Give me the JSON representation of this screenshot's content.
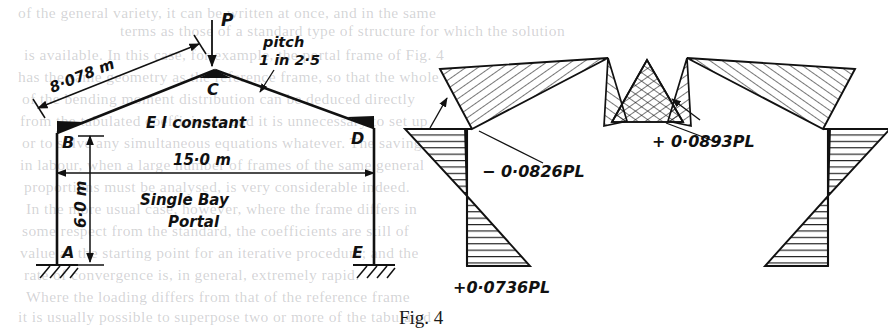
{
  "figure": {
    "caption": "Fig. 4"
  },
  "frame_diagram": {
    "name": "single-bay-portal-frame",
    "load_label": "P",
    "nodes": [
      {
        "id": "A",
        "label": "A",
        "role": "fixed-base-left"
      },
      {
        "id": "B",
        "label": "B",
        "role": "eaves-left"
      },
      {
        "id": "C",
        "label": "C",
        "role": "apex"
      },
      {
        "id": "D",
        "label": "D",
        "role": "eaves-right"
      },
      {
        "id": "E",
        "label": "E",
        "role": "fixed-base-right"
      }
    ],
    "annotations": {
      "rafter_length": "8·078 m",
      "pitch_line_1": "pitch",
      "pitch_line_2": "1 in 2·5",
      "stiffness": "E I  constant",
      "span": "15·0 m",
      "height": "6·0 m",
      "description_line_1": "Single    Bay",
      "description_line_2": "Portal"
    }
  },
  "bmd_diagram": {
    "name": "bending-moment-diagram",
    "labels": {
      "eaves_moment": "− 0·0826PL",
      "apex_moment": "+ 0·0893PL",
      "base_moment": "+0·0736PL"
    }
  },
  "chart_data": {
    "type": "line",
    "xlabel": "",
    "ylabel": "Bending moment (× PL)",
    "grid": false,
    "legend": null,
    "annotations": [
      {
        "text": "− 0·0826PL",
        "value": -0.0826,
        "at": "eaves B and D"
      },
      {
        "text": "+ 0·0893PL",
        "value": 0.0893,
        "at": "apex C"
      },
      {
        "text": "+0·0736PL",
        "value": 0.0736,
        "at": "bases A and E"
      }
    ],
    "categories": [
      "A",
      "B",
      "C",
      "D",
      "E"
    ],
    "values": [
      0.0736,
      -0.0826,
      0.0893,
      -0.0826,
      0.0736
    ],
    "geometry": {
      "span_m": 15.0,
      "column_height_m": 6.0,
      "rafter_length_m": 8.078,
      "pitch": "1 in 2.5"
    }
  },
  "bleed_through": {
    "lines": [
      {
        "text": "of the general variety, it can be written at once, and in the same",
        "x": 18,
        "y": 4
      },
      {
        "text": "terms as those of a standard type of structure for which the solution",
        "x": 120,
        "y": 22
      },
      {
        "text": "is available. In this case, for example, the portal frame of Fig. 4",
        "x": 24,
        "y": 46
      },
      {
        "text": "has the same geometry as the reference frame, so that the whole",
        "x": 18,
        "y": 68
      },
      {
        "text": "of the bending moment distribution can be deduced directly",
        "x": 22,
        "y": 90
      },
      {
        "text": "from the tabulated coefficients, and it is unnecessary to set up",
        "x": 20,
        "y": 112
      },
      {
        "text": "or to solve any simultaneous equations whatever. The saving",
        "x": 22,
        "y": 134
      },
      {
        "text": "in labour, when a large number of frames of the same general",
        "x": 20,
        "y": 156
      },
      {
        "text": "proportions must be analysed, is very considerable indeed.",
        "x": 24,
        "y": 178
      },
      {
        "text": "In the more usual case, however, where the frame differs in",
        "x": 26,
        "y": 200
      },
      {
        "text": "some respect from the standard, the coefficients are still of",
        "x": 22,
        "y": 222
      },
      {
        "text": "value as the starting point for an iterative procedure; and the",
        "x": 20,
        "y": 244
      },
      {
        "text": "rate of convergence is, in general, extremely rapid.",
        "x": 24,
        "y": 266
      },
      {
        "text": "Where the loading differs from that of the reference frame",
        "x": 26,
        "y": 288
      },
      {
        "text": "it is usually possible to superpose two or more of the tabulated",
        "x": 18,
        "y": 308
      }
    ]
  }
}
